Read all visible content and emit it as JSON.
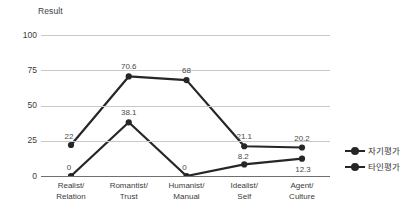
{
  "chart_data": {
    "type": "line",
    "title": "Result",
    "xlabel": "",
    "ylabel": "",
    "ylim": [
      0,
      100
    ],
    "yticks": [
      100,
      75,
      50,
      25,
      0
    ],
    "grid": true,
    "legend_position": "right",
    "categories": [
      "Realist/\nRelation",
      "Romantist/\nTrust",
      "Humanist/\nManual",
      "Idealist/\nSelf",
      "Agent/\nCulture"
    ],
    "category_lines": [
      [
        "Realist/",
        "Relation"
      ],
      [
        "Romantist/",
        "Trust"
      ],
      [
        "Humanist/",
        "Manual"
      ],
      [
        "Idealist/",
        "Self"
      ],
      [
        "Agent/",
        "Culture"
      ]
    ],
    "series": [
      {
        "name": "자기평가",
        "color": "#262626",
        "values": [
          22,
          70.6,
          68,
          21.1,
          20.2
        ],
        "labels": [
          "22",
          "70.6",
          "68",
          "21.1",
          "20.2"
        ]
      },
      {
        "name": "타인평가",
        "color": "#262626",
        "values": [
          0,
          38.1,
          0,
          8.2,
          12.3
        ],
        "labels": [
          "0",
          "38.1",
          "0",
          "8.2",
          "12.3"
        ]
      }
    ]
  },
  "axis": {
    "y_tick_labels": [
      "100",
      "75",
      "50",
      "25",
      "0"
    ]
  },
  "legend": {
    "items": [
      {
        "label": "자기평가"
      },
      {
        "label": "타인평가"
      }
    ]
  }
}
